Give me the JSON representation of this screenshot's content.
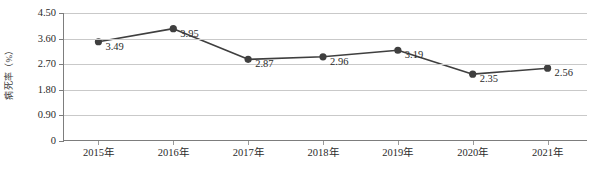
{
  "chart_data": {
    "type": "line",
    "title": "",
    "xlabel": "",
    "ylabel": "病死率（%）",
    "categories": [
      "2015年",
      "2016年",
      "2017年",
      "2018年",
      "2019年",
      "2020年",
      "2021年"
    ],
    "values": [
      3.49,
      3.95,
      2.87,
      2.96,
      3.19,
      2.35,
      2.56
    ],
    "point_labels": [
      "3.49",
      "3.95",
      "2.87",
      "2.96",
      "3.19",
      "2.35",
      "2.56"
    ],
    "ylim": [
      0,
      4.5
    ],
    "ytick_labels": [
      "0",
      "0.90",
      "1.80",
      "2.70",
      "3.60",
      "4.50"
    ],
    "ytick_values": [
      0,
      0.9,
      1.8,
      2.7,
      3.6,
      4.5
    ],
    "grid": true,
    "legend": null,
    "series": [
      {
        "name": "病死率",
        "values": [
          3.49,
          3.95,
          2.87,
          2.96,
          3.19,
          2.35,
          2.56
        ]
      }
    ],
    "colors": {
      "line": "#3f3f3f",
      "marker": "#3f3f3f",
      "gridline": "#c9c9c9",
      "axis": "#7d7d7d",
      "text": "#2b2b2b",
      "background": "#ffffff"
    }
  }
}
